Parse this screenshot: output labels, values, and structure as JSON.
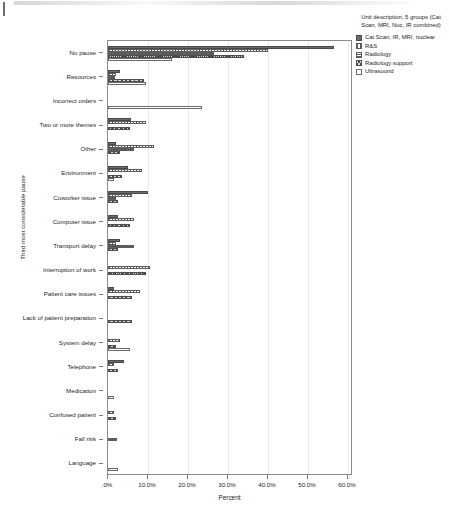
{
  "chart_data": {
    "type": "bar",
    "orientation": "horizontal",
    "title": "",
    "xlabel": "Percent",
    "ylabel": "Third most considerable pause",
    "xlim": [
      0,
      60
    ],
    "xtick_labels": [
      ".0%",
      "10.0%",
      "20.0%",
      "30.0%",
      "40.0%",
      "50.0%",
      "60.0%"
    ],
    "xtick_values": [
      0,
      10,
      20,
      30,
      40,
      50,
      60
    ],
    "grid": true,
    "legend_position": "right",
    "legend_title": "Unit description, 5 groups (Cat Scan, MRI, Nuc, IR combined)",
    "categories": [
      "No pause",
      "Resources",
      "Incorrect orders",
      "Two or more themes",
      "Other",
      "Environment",
      "Coworker issue",
      "Computer issue",
      "Transport delay",
      "Interruption of work",
      "Patient care issues",
      "Lack of patient preparation",
      "System delay",
      "Telephone",
      "Medication",
      "Confused patient",
      "Fall risk",
      "Language"
    ],
    "series": [
      {
        "name": "Cat Scan, IR, MRI, nuclear",
        "pattern": "solid-dark",
        "values": [
          56.5,
          3.0,
          0.0,
          5.8,
          2.0,
          5.0,
          10.0,
          2.5,
          3.0,
          0.0,
          1.5,
          0.0,
          0.0,
          4.0,
          0.0,
          0.0,
          0.0,
          0.0
        ]
      },
      {
        "name": "R&S",
        "pattern": "dotted",
        "values": [
          40.0,
          2.0,
          0.0,
          9.5,
          11.5,
          8.5,
          6.0,
          6.5,
          2.0,
          10.5,
          8.0,
          0.0,
          3.0,
          1.5,
          0.0,
          1.5,
          0.0,
          0.0
        ]
      },
      {
        "name": "Radiology",
        "pattern": "horizontal-lines",
        "values": [
          26.5,
          1.8,
          0.0,
          0.0,
          6.5,
          0.0,
          2.0,
          0.0,
          6.5,
          0.0,
          0.0,
          0.0,
          0.0,
          0.0,
          0.0,
          0.0,
          2.2,
          0.0
        ]
      },
      {
        "name": "Radiology support",
        "pattern": "cross-hatch",
        "values": [
          34.0,
          9.0,
          0.0,
          5.5,
          3.0,
          3.5,
          2.5,
          5.5,
          2.5,
          9.5,
          6.0,
          6.0,
          2.0,
          2.5,
          0.0,
          2.0,
          0.0,
          0.0
        ]
      },
      {
        "name": "Ultrasound",
        "pattern": "open",
        "values": [
          16.0,
          9.5,
          23.5,
          0.0,
          0.0,
          1.5,
          0.0,
          0.0,
          0.0,
          0.0,
          0.0,
          0.0,
          5.5,
          0.0,
          1.5,
          0.0,
          0.0,
          2.5
        ]
      }
    ]
  }
}
